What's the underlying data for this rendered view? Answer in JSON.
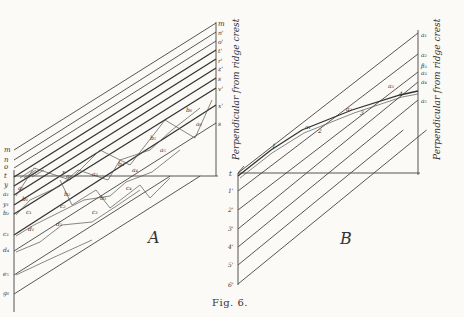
{
  "figure": {
    "caption": "Fig. 6.",
    "panel_a": {
      "label": "A",
      "axis_label": "Perpendicular from ridge crest",
      "left_labels": [
        "m",
        "n",
        "o",
        "t",
        "y",
        "a₁",
        "y₁",
        "b₂",
        "c₃",
        "d₄",
        "e₅",
        "g₆"
      ],
      "right_labels": [
        "m",
        "n'",
        "o'",
        "t'",
        "r'",
        "z'",
        "s",
        "v'",
        "x'",
        "s"
      ],
      "point_labels": [
        "a₁",
        "b₁",
        "c₁",
        "d₁",
        "a₂",
        "b₂",
        "c₂",
        "d₂",
        "a₃",
        "b₃",
        "c₃",
        "a₄",
        "b₄",
        "c₄",
        "a₅",
        "b₅",
        "a₆",
        "b₆"
      ],
      "slope_label": "x"
    },
    "panel_b": {
      "label": "B",
      "axis_label": "Perpendicular from ridge crest",
      "left_labels": [
        "t",
        "1'",
        "2'",
        "3'",
        "4'",
        "5'",
        "6'"
      ],
      "right_labels": [
        "a₁",
        "a₂",
        "β₃",
        "a₃",
        "a₄",
        "a₅"
      ],
      "point_labels": [
        "1",
        "a₁",
        "2",
        "a₂",
        "3",
        "a₃",
        "4"
      ]
    }
  }
}
